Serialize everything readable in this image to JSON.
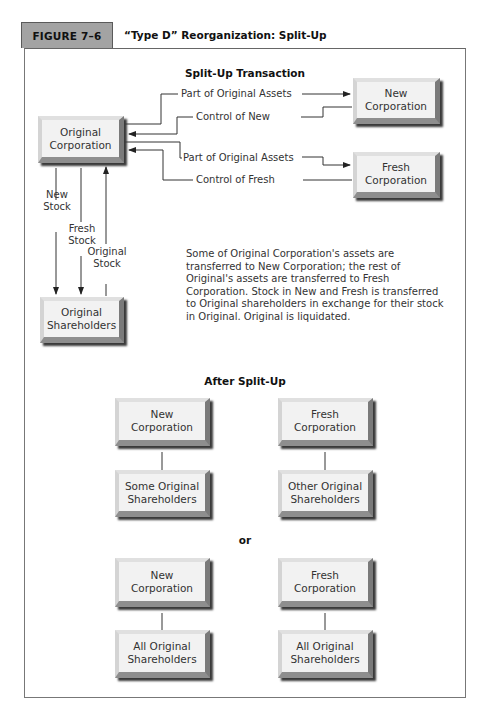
{
  "figure": {
    "number": "FIGURE 7–6",
    "title": "“Type D” Reorganization: Split-Up"
  },
  "transaction": {
    "heading": "Split-Up Transaction",
    "boxes": {
      "original_corporation": "Original Corporation",
      "new_corporation": "New Corporation",
      "fresh_corporation": "Fresh Corporation",
      "original_shareholders": "Original Shareholders"
    },
    "flows": {
      "part_assets_new": "Part of Original Assets",
      "control_new": "Control of New",
      "part_assets_fresh": "Part of Original Assets",
      "control_fresh": "Control of Fresh",
      "new_stock": "New Stock",
      "fresh_stock": "Fresh Stock",
      "original_stock": "Original Stock"
    },
    "description": "Some of Original Corporation's assets are transferred to New Corporation; the rest of Original's assets are transferred to Fresh Corporation. Stock in New and Fresh is transferred to Original shareholders in exchange for their stock in Original. Original is liquidated."
  },
  "after": {
    "heading": "After Split-Up",
    "option1": {
      "left_top": "New Corporation",
      "left_bottom": "Some Original Shareholders",
      "right_top": "Fresh Corporation",
      "right_bottom": "Other Original Shareholders"
    },
    "or_label": "or",
    "option2": {
      "left_top": "New Corporation",
      "left_bottom": "All Original Shareholders",
      "right_top": "Fresh Corporation",
      "right_bottom": "All Original Shareholders"
    }
  },
  "colors": {
    "tab_background": "#a3a3a3",
    "box_face": "#f2f2f2",
    "line": "#333333"
  }
}
